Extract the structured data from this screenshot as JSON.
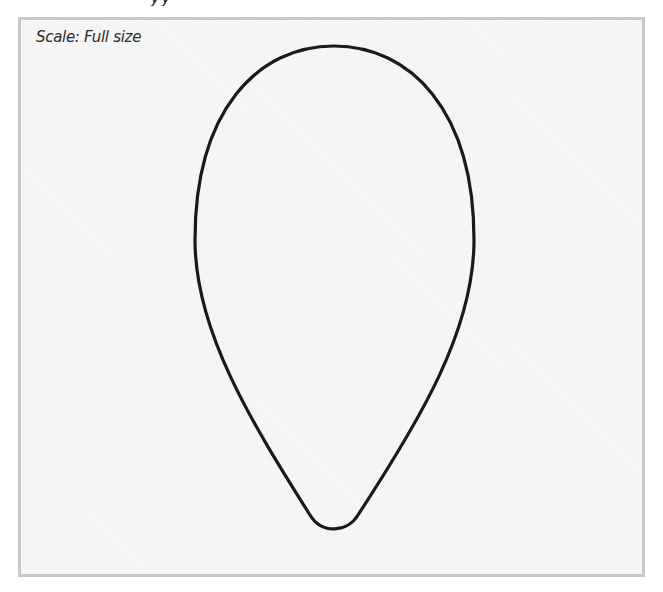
{
  "header": {
    "clipped_text": "yy"
  },
  "template": {
    "scale_label": "Scale: Full size",
    "shape": "teardrop-outline",
    "stroke_color": "#1a1a1a",
    "frame_border_color": "#c8c8c8",
    "frame_background": "#f6f6f6"
  }
}
